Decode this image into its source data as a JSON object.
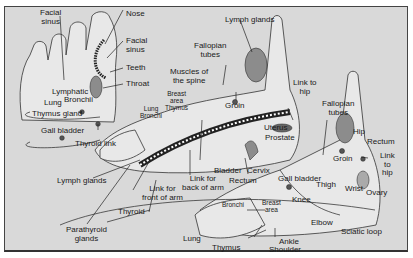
{
  "diagram": {
    "type": "reflexology foot map",
    "colors": {
      "background": "#d9d9d9",
      "foot_fill": "#e6e6e6",
      "organ_fill": "#8c8c8c",
      "line": "#2a2a2a",
      "dot": "#555555"
    },
    "labels": {
      "facial_sinus_top": "Facial\nsinus",
      "nose": "Nose",
      "facial_sinus_right": "Facial\nsinus",
      "teeth": "Teeth",
      "throat": "Throat",
      "lymphatic": "Lymphatic",
      "bronchii": "Bronchii",
      "lung_top": "Lung",
      "thymus_gland": "Thymus gland",
      "gall_bladder_left": "Gall bladder",
      "thyroid_link": "Thyroid link",
      "lymph_glands_left": "Lymph glands",
      "parathyroid_glands": "Parathyroid\nglands",
      "thyroid": "Thyroid",
      "link_front_arm": "Link for\nfront of arm",
      "link_back_arm": "Link for\nback of arm",
      "lung_bronchi_mid": "Lung\nBronchi",
      "breast_area_thymus": "Breast\narea\nThymus",
      "muscles_spine": "Muscles of\nthe spine",
      "fallopian_tubes_top": "Fallopian\ntubes",
      "lymph_glands_top": "Lymph glands",
      "groin_top": "Groin",
      "link_hip_top": "Link to\nhip",
      "fallopian_tubes_right": "Fallopian\ntubes",
      "uterus": "Uterus",
      "prostate": "Prostate",
      "bladder": "Bladder",
      "cervix": "Cervix",
      "rectum_mid": "Rectum",
      "gall_bladder_bottom": "Gall bladder",
      "hip": "Hip",
      "rectum_right": "Rectum",
      "link_hip_right": "Link\nto\nhip",
      "groin_right": "Groin",
      "thigh": "Thigh",
      "knee": "Knee",
      "wrist": "Wrist",
      "ovary": "Ovary",
      "elbow": "Elbow",
      "sciatic_loop": "Sciatic loop",
      "bronchi_bottom": "Bronchi",
      "breast_area_bottom": "Breast\narea",
      "lung_bottom": "Lung",
      "thymus_bottom": "Thymus",
      "ankle": "Ankle",
      "shoulder": "Shoulder"
    }
  }
}
